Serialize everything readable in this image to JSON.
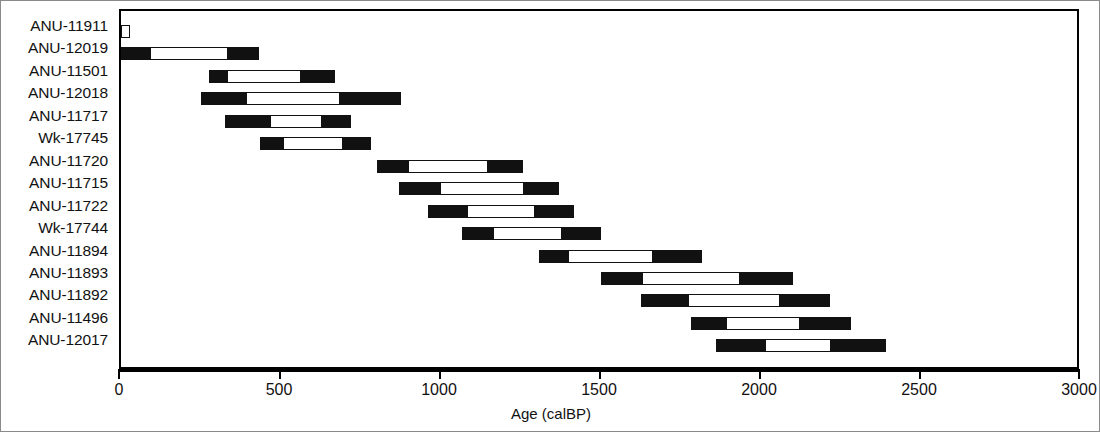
{
  "chart_data": {
    "type": "bar",
    "title": "",
    "subtitle": "",
    "xlabel": "Age (calBP)",
    "ylabel": "",
    "xlim": [
      0,
      3000
    ],
    "xticks": [
      0,
      500,
      1000,
      1500,
      2000,
      2500,
      3000
    ],
    "xtick_labels": [
      "0",
      "500",
      "1000",
      "1500",
      "2000",
      "2500",
      "3000"
    ],
    "grid": false,
    "legend": "none",
    "orientation": "horizontal",
    "categories": [
      "ANU-11911",
      "ANU-12019",
      "ANU-11501",
      "ANU-12018",
      "ANU-11717",
      "Wk-17745",
      "ANU-11720",
      "ANU-11715",
      "ANU-11722",
      "Wk-17744",
      "ANU-11894",
      "ANU-11893",
      "ANU-11892",
      "ANU-11496",
      "ANU-12017"
    ],
    "series": [
      {
        "name": "Calibrated age range (calBP)",
        "bars": [
          {
            "label": "ANU-11911",
            "start": 0,
            "end": 25,
            "inner_start": 0,
            "inner_end": 25
          },
          {
            "label": "ANU-12019",
            "start": 0,
            "end": 430,
            "inner_start": 95,
            "inner_end": 330
          },
          {
            "label": "ANU-11501",
            "start": 275,
            "end": 670,
            "inner_start": 335,
            "inner_end": 560
          },
          {
            "label": "ANU-12018",
            "start": 250,
            "end": 875,
            "inner_start": 395,
            "inner_end": 680
          },
          {
            "label": "ANU-11717",
            "start": 325,
            "end": 720,
            "inner_start": 470,
            "inner_end": 625
          },
          {
            "label": "Wk-17745",
            "start": 435,
            "end": 780,
            "inner_start": 510,
            "inner_end": 690
          },
          {
            "label": "ANU-11720",
            "start": 800,
            "end": 1255,
            "inner_start": 900,
            "inner_end": 1145
          },
          {
            "label": "ANU-11715",
            "start": 870,
            "end": 1370,
            "inner_start": 1000,
            "inner_end": 1255
          },
          {
            "label": "ANU-11722",
            "start": 960,
            "end": 1415,
            "inner_start": 1085,
            "inner_end": 1290
          },
          {
            "label": "Wk-17744",
            "start": 1065,
            "end": 1500,
            "inner_start": 1165,
            "inner_end": 1375
          },
          {
            "label": "ANU-11894",
            "start": 1305,
            "end": 1815,
            "inner_start": 1400,
            "inner_end": 1660
          },
          {
            "label": "ANU-11893",
            "start": 1500,
            "end": 2100,
            "inner_start": 1630,
            "inner_end": 1930
          },
          {
            "label": "ANU-11892",
            "start": 1625,
            "end": 2215,
            "inner_start": 1775,
            "inner_end": 2055
          },
          {
            "label": "ANU-11496",
            "start": 1780,
            "end": 2280,
            "inner_start": 1895,
            "inner_end": 2120
          },
          {
            "label": "ANU-12017",
            "start": 1860,
            "end": 2390,
            "inner_start": 2015,
            "inner_end": 2215
          }
        ]
      }
    ],
    "colors": {
      "bar_outer": "#111111",
      "bar_inner": "#ffffff",
      "axis": "#000000",
      "frame": "#000000",
      "background": "#ffffff"
    }
  }
}
